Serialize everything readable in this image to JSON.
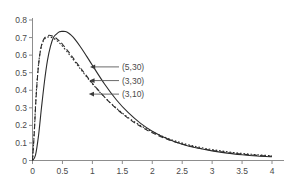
{
  "chart_data": {
    "type": "line",
    "title": "",
    "subtitle": "",
    "xlabel": "",
    "ylabel": "",
    "xlim": [
      0,
      4
    ],
    "ylim": [
      0,
      0.8
    ],
    "grid": false,
    "legend_position": "inline-annotations",
    "x_ticks": [
      "0",
      "0.5",
      "1",
      "1.5",
      "2",
      "2.5",
      "3",
      "3.5",
      "4"
    ],
    "x_tick_values": [
      0,
      0.5,
      1,
      1.5,
      2,
      2.5,
      3,
      3.5,
      4
    ],
    "y_ticks": [
      "0",
      "0.1",
      "0.2",
      "0.3",
      "0.4",
      "0.5",
      "0.6",
      "0.7",
      "0.8"
    ],
    "y_tick_values": [
      0,
      0.1,
      0.2,
      0.3,
      0.4,
      0.5,
      0.6,
      0.7,
      0.8
    ],
    "series": [
      {
        "name": "(5,30)",
        "style": "solid",
        "color": "#2b2b2b",
        "peak_x": 0.55,
        "peak_y": 0.735,
        "x": [
          0,
          0.05,
          0.1,
          0.15,
          0.2,
          0.25,
          0.3,
          0.35,
          0.4,
          0.45,
          0.5,
          0.55,
          0.6,
          0.65,
          0.7,
          0.8,
          0.9,
          1.0,
          1.2,
          1.4,
          1.6,
          1.8,
          2.0,
          2.25,
          2.5,
          2.75,
          3.0,
          3.25,
          3.5,
          3.75,
          4.0
        ],
        "values": [
          0.0,
          0.03,
          0.14,
          0.3,
          0.45,
          0.57,
          0.65,
          0.7,
          0.72,
          0.733,
          0.735,
          0.734,
          0.726,
          0.712,
          0.694,
          0.648,
          0.596,
          0.542,
          0.437,
          0.346,
          0.272,
          0.213,
          0.167,
          0.124,
          0.093,
          0.071,
          0.055,
          0.042,
          0.033,
          0.026,
          0.021
        ]
      },
      {
        "name": "(3,30)",
        "style": "dashed",
        "color": "#2b2b2b",
        "peak_x": 0.31,
        "peak_y": 0.712,
        "x": [
          0,
          0.03,
          0.06,
          0.1,
          0.14,
          0.18,
          0.22,
          0.26,
          0.3,
          0.35,
          0.4,
          0.45,
          0.5,
          0.6,
          0.7,
          0.8,
          0.9,
          1.0,
          1.2,
          1.4,
          1.6,
          1.8,
          2.0,
          2.25,
          2.5,
          2.75,
          3.0,
          3.25,
          3.5,
          3.75,
          4.0
        ],
        "values": [
          0.0,
          0.16,
          0.36,
          0.54,
          0.64,
          0.685,
          0.705,
          0.712,
          0.712,
          0.706,
          0.695,
          0.68,
          0.662,
          0.62,
          0.574,
          0.528,
          0.483,
          0.44,
          0.362,
          0.296,
          0.24,
          0.195,
          0.158,
          0.121,
          0.094,
          0.073,
          0.057,
          0.045,
          0.036,
          0.029,
          0.024
        ]
      },
      {
        "name": "(3,10)",
        "style": "dotted",
        "color": "#2b2b2b",
        "peak_x": 0.3,
        "peak_y": 0.703,
        "x": [
          0,
          0.03,
          0.06,
          0.1,
          0.14,
          0.18,
          0.22,
          0.26,
          0.3,
          0.35,
          0.4,
          0.45,
          0.5,
          0.6,
          0.7,
          0.8,
          0.9,
          1.0,
          1.2,
          1.4,
          1.6,
          1.8,
          2.0,
          2.25,
          2.5,
          2.75,
          3.0,
          3.25,
          3.5,
          3.75,
          4.0
        ],
        "values": [
          0.0,
          0.17,
          0.37,
          0.545,
          0.638,
          0.68,
          0.698,
          0.703,
          0.703,
          0.696,
          0.684,
          0.669,
          0.651,
          0.61,
          0.566,
          0.521,
          0.478,
          0.437,
          0.362,
          0.298,
          0.244,
          0.2,
          0.164,
          0.127,
          0.099,
          0.078,
          0.062,
          0.05,
          0.04,
          0.033,
          0.027
        ]
      }
    ],
    "annotations": [
      {
        "label": "(5,30)",
        "target_x": 0.96,
        "target_y": 0.533,
        "text_x": 4.3,
        "text_y": 0.58
      },
      {
        "label": "(3,30)",
        "target_x": 0.95,
        "target_y": 0.455,
        "text_x": 4.3,
        "text_y": 0.49
      },
      {
        "label": "(3,10)",
        "target_x": 0.94,
        "target_y": 0.378,
        "text_x": 4.3,
        "text_y": 0.4
      }
    ]
  }
}
